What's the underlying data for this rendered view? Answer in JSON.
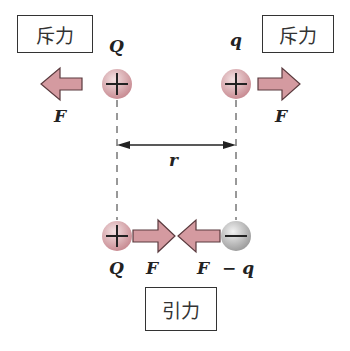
{
  "labels": {
    "repulsion": "斥力",
    "attraction": "引力",
    "charge_Q": "Q",
    "charge_q": "q",
    "charge_neg_q": "− q",
    "force": "F",
    "distance": "r"
  },
  "colors": {
    "positive_charge": "#d9a6ab",
    "negative_charge": "#bdbdbd",
    "arrow_fill": "#d49aa0",
    "arrow_stroke": "#5a3a3e",
    "text": "#222222"
  }
}
